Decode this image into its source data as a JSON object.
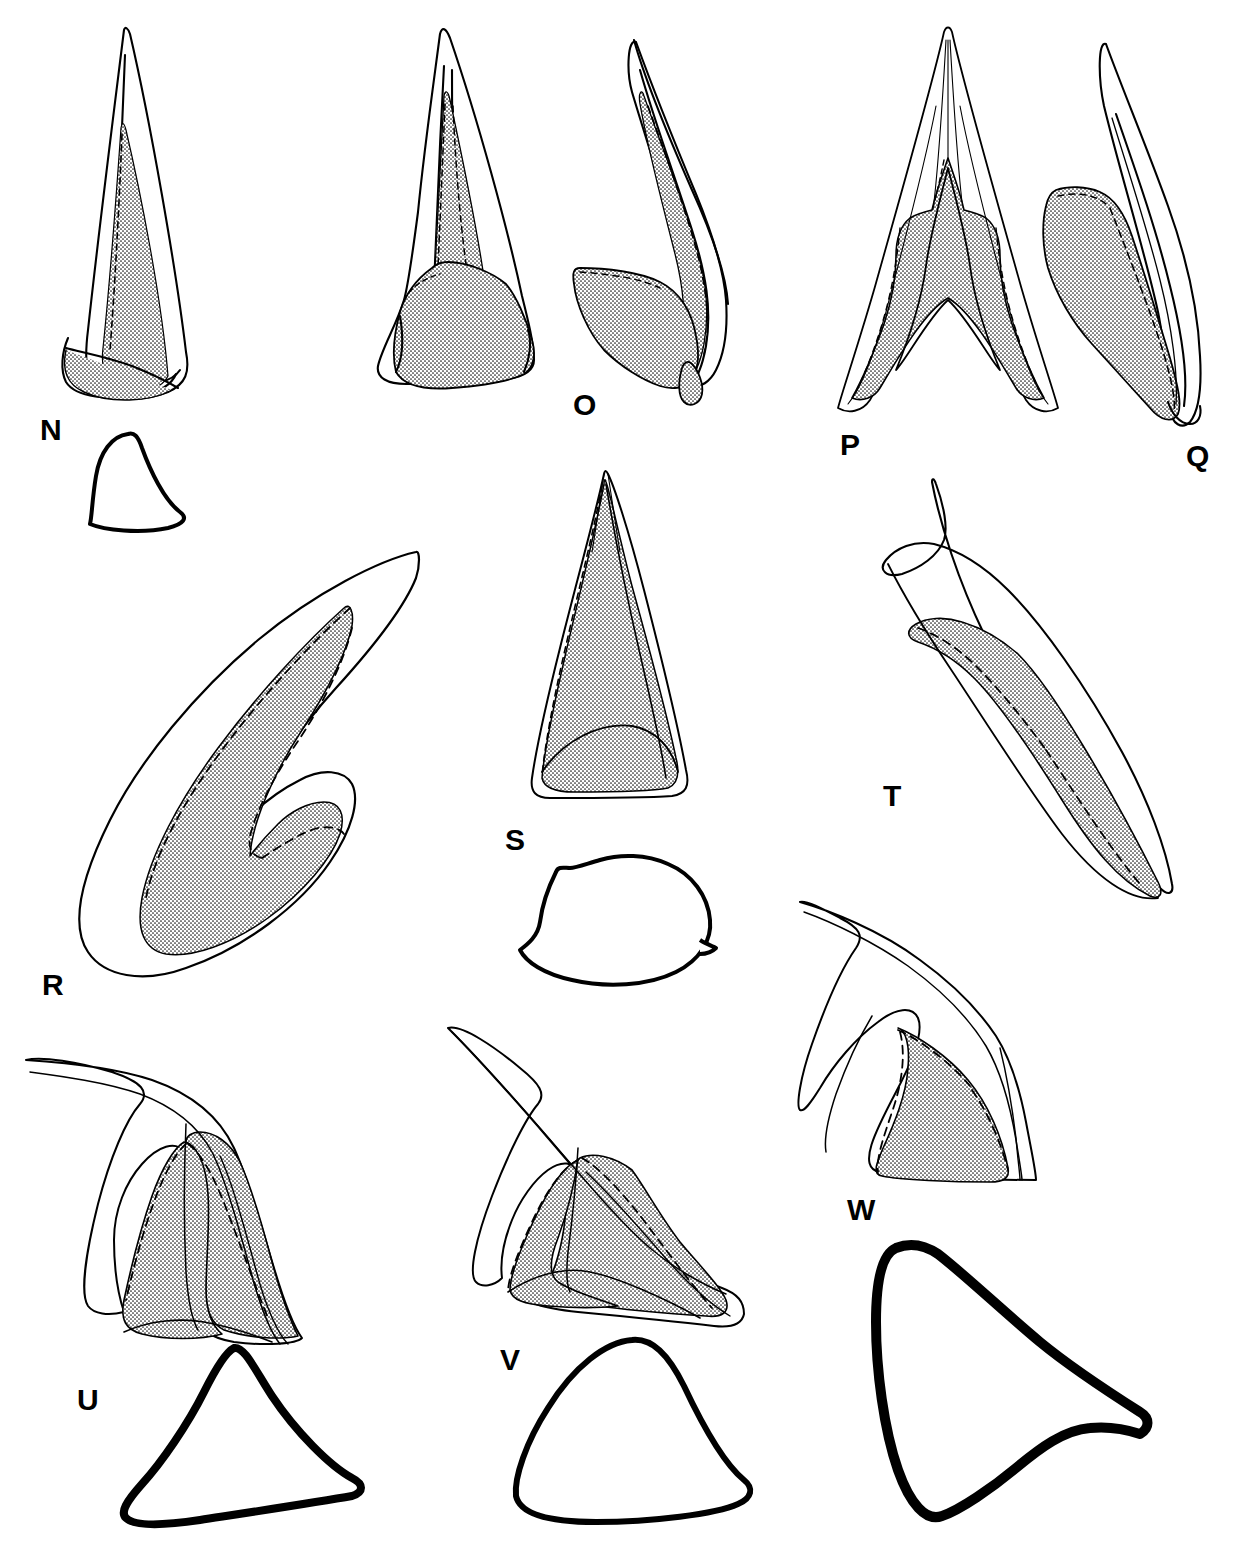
{
  "plate": {
    "title": "Scientific specimen illustration plate",
    "description": "Line-drawing plate of conodont / sclerite elements with stippled (dotted) basal cavity fill, dashed internal margins, and heavy-outline cross-section drawings.",
    "background_color": "#ffffff",
    "line_color": "#000000",
    "stipple_color": "#1a1a1a",
    "width": 1233,
    "height": 1555
  },
  "figure_labels": [
    {
      "id": "N",
      "text": "N",
      "x": 40,
      "y": 410
    },
    {
      "id": "O",
      "text": "O",
      "x": 573,
      "y": 385
    },
    {
      "id": "P",
      "text": "P",
      "x": 840,
      "y": 425
    },
    {
      "id": "Q",
      "text": "Q",
      "x": 1186,
      "y": 436
    },
    {
      "id": "R",
      "text": "R",
      "x": 42,
      "y": 965
    },
    {
      "id": "S",
      "text": "S",
      "x": 505,
      "y": 820
    },
    {
      "id": "T",
      "text": "T",
      "x": 883,
      "y": 776
    },
    {
      "id": "U",
      "text": "U",
      "x": 77,
      "y": 1380
    },
    {
      "id": "V",
      "text": "V",
      "x": 500,
      "y": 1340
    },
    {
      "id": "W",
      "text": "W",
      "x": 847,
      "y": 1190
    }
  ],
  "specimens": [
    {
      "label": "N",
      "name": "specimen-n",
      "kind": "elongate-cusp-lateral-view",
      "has_stipple": true,
      "has_dashed_margin": true,
      "cross_section_outline": true
    },
    {
      "label": "O",
      "name": "specimen-o",
      "kind": "paired-recurved-cusp-two-views",
      "has_stipple": true,
      "has_dashed_margin": true,
      "cross_section_outline": false
    },
    {
      "label": "P",
      "name": "specimen-p",
      "kind": "symmetrical-arched-element-anterior-view",
      "has_stipple": true,
      "has_dashed_margin": true,
      "cross_section_outline": false
    },
    {
      "label": "Q",
      "name": "specimen-q",
      "kind": "recurved-asymmetric-element-lateral-view",
      "has_stipple": true,
      "has_dashed_margin": true,
      "cross_section_outline": false
    },
    {
      "label": "R",
      "name": "specimen-r",
      "kind": "large-hooked-claw-element",
      "has_stipple": true,
      "has_dashed_margin": true,
      "cross_section_outline": false
    },
    {
      "label": "S",
      "name": "specimen-s",
      "kind": "broad-triangular-element-anterior-view",
      "has_stipple": true,
      "has_dashed_margin": true,
      "cross_section_outline": true
    },
    {
      "label": "T",
      "name": "specimen-t",
      "kind": "sharply-recurved-blade-element",
      "has_stipple": true,
      "has_dashed_margin": true,
      "cross_section_outline": false
    },
    {
      "label": "U",
      "name": "specimen-u",
      "kind": "reclined-cusp-with-broad-base",
      "has_stipple": true,
      "has_dashed_margin": true,
      "cross_section_outline": true
    },
    {
      "label": "V",
      "name": "specimen-v",
      "kind": "reclined-cusp-with-flared-base",
      "has_stipple": true,
      "has_dashed_margin": true,
      "cross_section_outline": true
    },
    {
      "label": "W",
      "name": "specimen-w",
      "kind": "recurved-cusp-with-wide-base",
      "has_stipple": true,
      "has_dashed_margin": true,
      "cross_section_outline": true
    }
  ],
  "cross_sections": [
    {
      "belongs_to": "N",
      "name": "cross-section-n",
      "stroke_width": 4
    },
    {
      "belongs_to": "S",
      "name": "cross-section-s",
      "stroke_width": 4
    },
    {
      "belongs_to": "U",
      "name": "cross-section-u",
      "stroke_width": 8
    },
    {
      "belongs_to": "V",
      "name": "cross-section-v",
      "stroke_width": 6
    },
    {
      "belongs_to": "W",
      "name": "cross-section-w",
      "stroke_width": 10
    }
  ]
}
